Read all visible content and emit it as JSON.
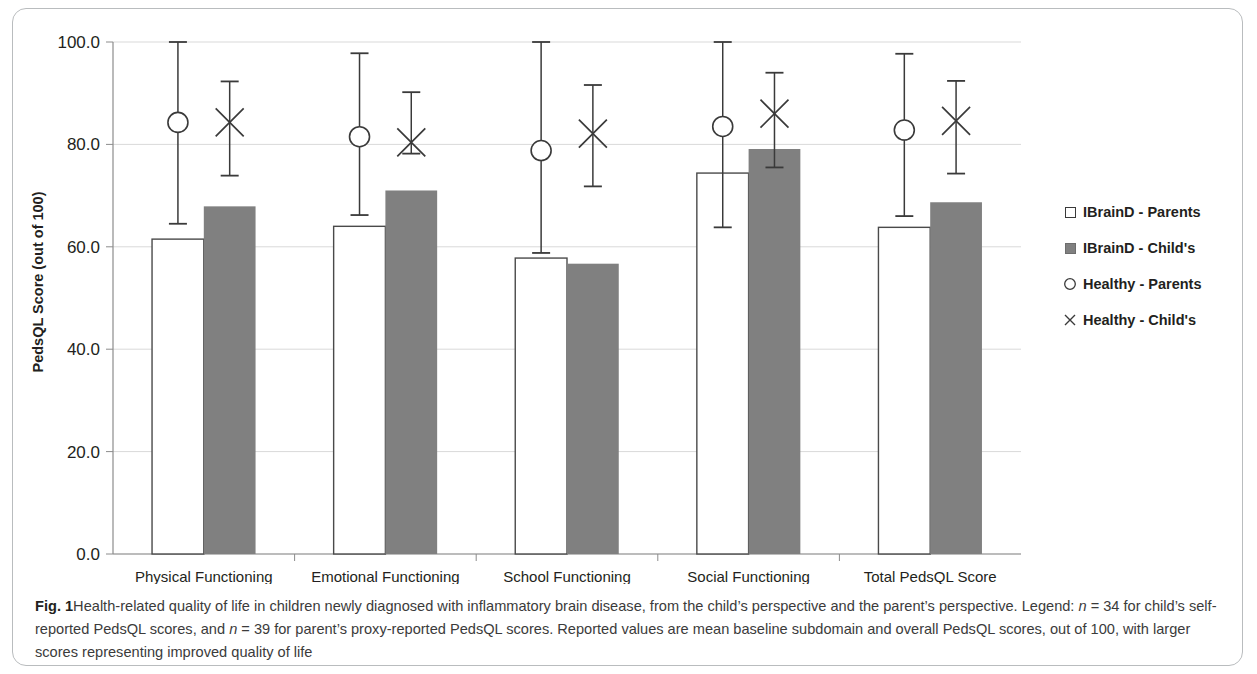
{
  "figure": {
    "label": "Fig. 1",
    "caption_part1": "Health-related quality of life in children newly diagnosed with inflammatory brain disease, from the child’s perspective and the parent’s perspective. Legend: ",
    "n_child_var": "n",
    "n_child_val": " = 34 for child’s self-reported PedsQL scores, and ",
    "n_parent_var": "n",
    "n_parent_val": " = 39 for parent’s proxy-reported PedsQL scores. Reported values are mean baseline subdomain and overall PedsQL scores, out of 100, with larger scores representing improved quality of life"
  },
  "colors": {
    "bar_open_fill": "#ffffff",
    "bar_open_stroke": "#4a4a4a",
    "bar_filled": "#808080",
    "gridline": "#d9d9d9",
    "axis": "#8c8c8c",
    "marker": "#3a3a3a",
    "text": "#231f20",
    "card_border": "#b9bcbe"
  },
  "legend": {
    "items": [
      {
        "label": "IBrainD - Parents",
        "marker": "open-square"
      },
      {
        "label": "IBrainD - Child's",
        "marker": "filled-square"
      },
      {
        "label": "Healthy - Parents",
        "marker": "open-circle"
      },
      {
        "label": "Healthy - Child's",
        "marker": "cross"
      }
    ]
  },
  "chart_data": {
    "type": "bar",
    "title": "",
    "xlabel": "",
    "ylabel": "PedsQL Score (out of 100)",
    "ylim": [
      0,
      100
    ],
    "yticks": [
      "0.0",
      "20.0",
      "40.0",
      "60.0",
      "80.0",
      "100.0"
    ],
    "ytick_values": [
      0,
      20,
      40,
      60,
      80,
      100
    ],
    "grid": true,
    "legend_position": "right",
    "categories": [
      "Physical Functioning",
      "Emotional Functioning",
      "School Functioning",
      "Social Functioning",
      "Total PedsQL Score"
    ],
    "series": [
      {
        "name": "IBrainD - Parents",
        "style": "open-bar",
        "values": [
          61.5,
          64.0,
          57.8,
          74.4,
          63.8
        ]
      },
      {
        "name": "IBrainD - Child's",
        "style": "filled-bar",
        "values": [
          67.9,
          71.0,
          56.7,
          79.1,
          68.7
        ]
      },
      {
        "name": "Healthy - Parents",
        "style": "open-circle-with-errorbar",
        "values": [
          84.3,
          81.5,
          78.8,
          83.5,
          82.8
        ],
        "error_low": [
          64.5,
          66.2,
          58.8,
          63.8,
          66.0
        ],
        "error_high": [
          100.0,
          97.8,
          100.0,
          100.0,
          97.7
        ]
      },
      {
        "name": "Healthy - Child's",
        "style": "cross-with-errorbar",
        "values": [
          84.3,
          80.4,
          82.1,
          86.0,
          84.6
        ],
        "error_low": [
          73.9,
          78.2,
          71.8,
          75.5,
          74.3
        ],
        "error_high": [
          92.3,
          90.2,
          91.6,
          94.0,
          92.4
        ]
      }
    ]
  }
}
